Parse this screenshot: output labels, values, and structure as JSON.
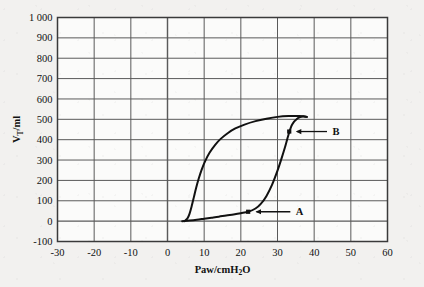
{
  "chart_data": {
    "type": "line",
    "title": "",
    "subtitle": "",
    "xlabel": "Paw/cmH2O",
    "xlabel_parts": {
      "pre": "Paw/cmH",
      "sub": "2",
      "post": "O"
    },
    "ylabel": "VT/ml",
    "ylabel_parts": {
      "pre": "V",
      "sub": "T",
      "post": "/ml"
    },
    "xlim": [
      -30,
      60
    ],
    "ylim": [
      -100,
      1000
    ],
    "xticks": [
      -30,
      -20,
      -10,
      0,
      10,
      20,
      30,
      40,
      50,
      60
    ],
    "xtick_labels": [
      "-30",
      "-20",
      "-10",
      "0",
      "10",
      "20",
      "30",
      "40",
      "50",
      "60"
    ],
    "yticks": [
      -100,
      0,
      100,
      200,
      300,
      400,
      500,
      600,
      700,
      800,
      900,
      1000
    ],
    "ytick_labels": [
      "-100",
      "0",
      "100",
      "200",
      "300",
      "400",
      "500",
      "600",
      "700",
      "800",
      "900",
      "1 000"
    ],
    "grid": true,
    "grid_color": "#5a5a5a",
    "curve_color": "#111111",
    "background_color": "#f2f1ef",
    "legend": "none",
    "series": [
      {
        "name": "inspiratory-limb",
        "description": "lower inflation limb rising from zero volume, through point A, then steeply up to the loop tip",
        "points": [
          [
            4.0,
            0
          ],
          [
            6.0,
            3
          ],
          [
            8.0,
            7
          ],
          [
            10.0,
            12
          ],
          [
            12.0,
            17
          ],
          [
            14.0,
            22
          ],
          [
            16.0,
            28
          ],
          [
            18.0,
            33
          ],
          [
            20.0,
            39
          ],
          [
            22.0,
            46
          ],
          [
            24.0,
            62
          ],
          [
            25.5,
            86
          ],
          [
            27.0,
            124
          ],
          [
            28.5,
            178
          ],
          [
            30.0,
            248
          ],
          [
            31.0,
            302
          ],
          [
            32.0,
            360
          ],
          [
            33.0,
            424
          ],
          [
            34.0,
            474
          ],
          [
            35.5,
            505
          ],
          [
            37.0,
            515
          ],
          [
            38.0,
            512
          ]
        ]
      },
      {
        "name": "expiratory-limb",
        "description": "upper deflation limb from the loop tip leftwards and down to zero volume",
        "points": [
          [
            38.0,
            512
          ],
          [
            36.0,
            516
          ],
          [
            33.0,
            516
          ],
          [
            30.0,
            512
          ],
          [
            27.0,
            503
          ],
          [
            24.0,
            491
          ],
          [
            21.0,
            474
          ],
          [
            18.5,
            455
          ],
          [
            16.5,
            433
          ],
          [
            14.5,
            404
          ],
          [
            13.0,
            375
          ],
          [
            11.5,
            337
          ],
          [
            10.3,
            296
          ],
          [
            9.3,
            252
          ],
          [
            8.5,
            208
          ],
          [
            7.8,
            163
          ],
          [
            7.2,
            118
          ],
          [
            6.6,
            74
          ],
          [
            6.0,
            36
          ],
          [
            5.4,
            12
          ],
          [
            4.6,
            0
          ]
        ]
      }
    ],
    "annotations": [
      {
        "name": "A",
        "label": "A",
        "point": [
          22.0,
          46
        ],
        "marker": "square",
        "arrow_from": [
          33.5,
          46
        ],
        "arrow_to": [
          24.0,
          46
        ],
        "label_at": [
          35.0,
          46
        ],
        "meaning": "lower inflection point"
      },
      {
        "name": "B",
        "label": "B",
        "point": [
          33.2,
          440
        ],
        "marker": "square",
        "arrow_from": [
          43.5,
          440
        ],
        "arrow_to": [
          35.0,
          440
        ],
        "label_at": [
          45.0,
          440
        ],
        "meaning": "upper inflection point"
      }
    ]
  }
}
